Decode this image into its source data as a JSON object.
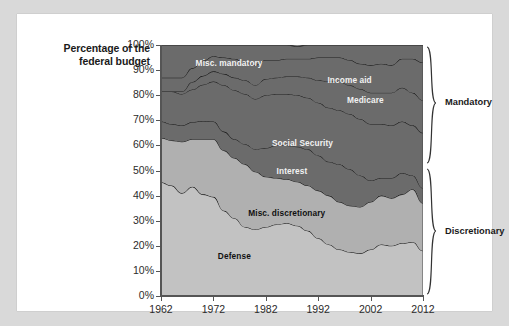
{
  "axis_title": "Percentage of the\nfederal budget",
  "axis_title_line1": "Percentage of the",
  "axis_title_line2": "federal budget",
  "colors": {
    "page_background": "#d9d9d9",
    "card_background": "#ffffff",
    "misc_mandatory": "#6b6b6b",
    "income_aid": "#6b6b6b",
    "medicare": "#6b6b6b",
    "social_security": "#6b6b6b",
    "interest": "#6b6b6b",
    "misc_discretionary": "#b0b0b0",
    "defense": "#c2c2c2",
    "stroke": "#1f1f1f",
    "text": "#1a1a1a"
  },
  "group_brackets": [
    {
      "label": "Mandatory"
    },
    {
      "label": "Discretionary"
    }
  ],
  "chart_data": {
    "type": "area",
    "stacked": true,
    "title": "",
    "xlabel": "",
    "ylabel": "Percentage of the federal budget",
    "xlim": [
      1962,
      2012
    ],
    "ylim": [
      0,
      100
    ],
    "grid": false,
    "legend_position": "in-plot labels",
    "ytick_labels": [
      "0%",
      "10%",
      "20%",
      "30%",
      "40%",
      "50%",
      "60%",
      "70%",
      "80%",
      "90%",
      "100%"
    ],
    "ytick_values": [
      0,
      10,
      20,
      30,
      40,
      50,
      60,
      70,
      80,
      90,
      100
    ],
    "xtick_labels": [
      "1962",
      "1972",
      "1982",
      "1992",
      "2002",
      "2012"
    ],
    "xtick_values": [
      1962,
      1972,
      1982,
      1992,
      2002,
      2012
    ],
    "x": [
      1962,
      1964,
      1966,
      1968,
      1970,
      1972,
      1974,
      1976,
      1978,
      1980,
      1982,
      1984,
      1986,
      1988,
      1990,
      1992,
      1994,
      1996,
      1998,
      2000,
      2002,
      2004,
      2006,
      2008,
      2010,
      2012
    ],
    "series": [
      {
        "name": "Defense",
        "label": "Defense",
        "color": "#c2c2c2",
        "group": "Discretionary",
        "values": [
          45.3,
          44.0,
          41.0,
          43.5,
          40.5,
          39.5,
          34.0,
          31.0,
          27.5,
          26.5,
          27.5,
          28.5,
          29.0,
          28.0,
          26.0,
          23.0,
          20.5,
          18.5,
          17.5,
          17.0,
          18.5,
          20.5,
          20.0,
          21.0,
          21.5,
          18.0
        ]
      },
      {
        "name": "Misc. discretionary",
        "label": "Misc. discretionary",
        "color": "#b0b0b0",
        "group": "Discretionary",
        "values": [
          17.7,
          18.0,
          20.5,
          19.0,
          22.0,
          23.0,
          24.0,
          24.0,
          25.0,
          23.0,
          20.0,
          18.5,
          17.5,
          17.5,
          18.0,
          19.0,
          19.5,
          19.0,
          18.5,
          18.5,
          19.0,
          19.5,
          19.0,
          19.5,
          21.0,
          19.0
        ]
      },
      {
        "name": "Interest",
        "label": "Interest",
        "color": "#6b6b6b",
        "group": "Mandatory",
        "values": [
          6.5,
          6.5,
          6.5,
          6.8,
          7.2,
          7.0,
          7.5,
          7.5,
          8.0,
          9.0,
          11.5,
          13.0,
          13.5,
          14.0,
          14.5,
          14.0,
          13.5,
          15.0,
          14.5,
          12.5,
          8.5,
          7.0,
          8.0,
          8.5,
          5.5,
          6.0
        ]
      },
      {
        "name": "Social Security",
        "label": "Social Security",
        "color": "#6b6b6b",
        "group": "Mandatory",
        "values": [
          12.0,
          13.0,
          12.5,
          13.0,
          14.5,
          16.0,
          18.5,
          19.5,
          20.0,
          20.0,
          21.0,
          20.5,
          20.5,
          20.5,
          20.5,
          21.0,
          21.5,
          21.5,
          22.0,
          22.5,
          22.5,
          21.5,
          21.0,
          20.5,
          20.0,
          22.0
        ]
      },
      {
        "name": "Medicare",
        "label": "Medicare",
        "color": "#6b6b6b",
        "group": "Mandatory",
        "values": [
          0.0,
          0.0,
          1.0,
          3.0,
          3.5,
          4.0,
          4.5,
          5.0,
          5.5,
          5.5,
          6.5,
          6.5,
          7.0,
          7.5,
          8.0,
          9.0,
          10.5,
          11.5,
          11.5,
          12.0,
          12.5,
          12.5,
          13.0,
          13.5,
          13.0,
          13.0
        ]
      },
      {
        "name": "Income aid",
        "label": "Income aid",
        "color": "#6b6b6b",
        "group": "Mandatory",
        "values": [
          5.5,
          5.5,
          5.5,
          5.5,
          6.0,
          6.0,
          6.5,
          7.5,
          7.0,
          8.0,
          7.5,
          7.0,
          7.0,
          7.0,
          7.5,
          9.0,
          9.5,
          9.5,
          10.0,
          10.0,
          11.0,
          11.5,
          11.0,
          11.5,
          13.5,
          15.0
        ]
      },
      {
        "name": "Misc. mandatory",
        "label": "Misc. mandatory",
        "color": "#6b6b6b",
        "group": "Mandatory",
        "values": [
          13.0,
          13.0,
          13.0,
          9.2,
          6.3,
          4.5,
          5.0,
          5.5,
          7.0,
          8.0,
          6.0,
          6.0,
          5.5,
          5.0,
          5.5,
          5.0,
          5.0,
          5.0,
          6.0,
          7.5,
          8.0,
          7.5,
          8.0,
          5.5,
          5.5,
          7.0
        ]
      }
    ],
    "annotations": [
      {
        "text": "Misc. mandatory",
        "x": 1975,
        "y": 93
      },
      {
        "text": "Income aid",
        "x": 1998,
        "y": 86
      },
      {
        "text": "Medicare",
        "x": 2001,
        "y": 78
      },
      {
        "text": "Social Security",
        "x": 1989,
        "y": 61
      },
      {
        "text": "Interest",
        "x": 1987,
        "y": 50
      },
      {
        "text": "Misc. discretionary",
        "x": 1986,
        "y": 33
      },
      {
        "text": "Defense",
        "x": 1976,
        "y": 16
      }
    ]
  }
}
